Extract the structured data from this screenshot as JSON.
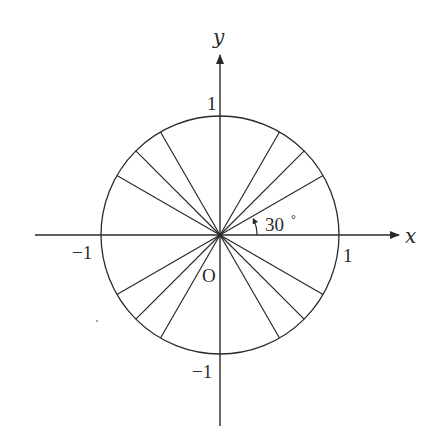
{
  "diagram": {
    "type": "unit-circle-with-rays",
    "colors": {
      "background": "#ffffff",
      "ink": "#2a2a2a"
    },
    "axes": {
      "x_label": "x",
      "y_label": "y"
    },
    "ticks": {
      "x_positive": "1",
      "x_negative": "−1",
      "y_positive": "1",
      "y_negative": "−1"
    },
    "origin_label": "O",
    "circle": {
      "radius_units": 1
    },
    "rays_degrees": [
      30,
      45,
      60,
      120,
      135,
      150,
      210,
      225,
      240,
      300,
      315,
      330
    ],
    "angle_annotation": {
      "value": "30",
      "unit": "°",
      "from_degrees": 0,
      "to_degrees": 30
    }
  }
}
